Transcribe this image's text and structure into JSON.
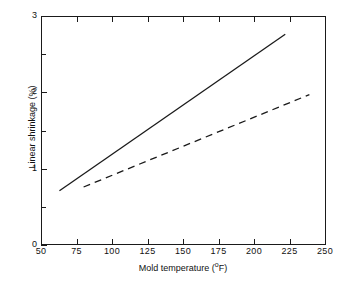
{
  "chart_data": {
    "type": "line",
    "title": "",
    "xlabel": "Mold temperature (°F)",
    "ylabel": "Linear shrinkage (%)",
    "xlim": [
      50,
      250
    ],
    "ylim": [
      0,
      3
    ],
    "xticks": [
      50,
      75,
      100,
      125,
      150,
      175,
      200,
      225,
      250
    ],
    "xticklabels": [
      "50",
      "75",
      "100",
      "125",
      "150",
      "175",
      "200",
      "225",
      "250"
    ],
    "yticks": [
      0,
      1,
      2,
      3
    ],
    "yticklabels": [
      "0",
      "1",
      "2",
      "3"
    ],
    "yminorticks": [
      0.5,
      1.5,
      2.5
    ],
    "grid": false,
    "legend": "none",
    "series": [
      {
        "name": "solid-line",
        "style": "solid",
        "color": "#1a1a1a",
        "x": [
          63,
          222
        ],
        "y": [
          0.71,
          2.76
        ]
      },
      {
        "name": "dashed-line",
        "style": "dashed",
        "color": "#1a1a1a",
        "x": [
          80,
          239
        ],
        "y": [
          0.76,
          1.97
        ]
      }
    ]
  },
  "axis": {
    "x_title_main": "Mold temperature (",
    "x_title_sup": "o",
    "x_title_tail": "F)",
    "y_title": "Linear shrinkage (%)"
  },
  "colors": {
    "background": "#ffffff",
    "ink": "#1a1a1a"
  }
}
